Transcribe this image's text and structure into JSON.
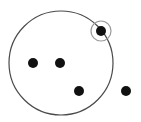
{
  "diagram": {
    "width": 141,
    "height": 122,
    "colors": {
      "background": "#ffffff",
      "big_circle_stroke": "#4a4a4a",
      "small_circle_stroke": "#9a9a9a",
      "point_fill": "#111111"
    },
    "big_circle": {
      "cx": 61,
      "cy": 63,
      "r": 52
    },
    "highlight_circle": {
      "cx": 101,
      "cy": 31,
      "r": 10
    },
    "points": [
      {
        "cx": 101,
        "cy": 31,
        "r": 5,
        "highlighted": true
      },
      {
        "cx": 33,
        "cy": 63,
        "r": 5,
        "highlighted": false
      },
      {
        "cx": 60,
        "cy": 63,
        "r": 5,
        "highlighted": false
      },
      {
        "cx": 79,
        "cy": 91,
        "r": 5,
        "highlighted": false
      },
      {
        "cx": 126,
        "cy": 91,
        "r": 5,
        "highlighted": false
      }
    ]
  }
}
